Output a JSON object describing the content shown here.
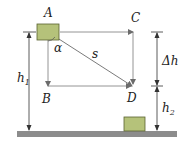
{
  "diagram": {
    "type": "physics-kinematics",
    "labels": {
      "A": "A",
      "B": "B",
      "C": "C",
      "D": "D",
      "s": "s",
      "alpha": "α",
      "h1_main": "h",
      "h1_sub": "1",
      "h2_main": "h",
      "h2_sub": "2",
      "delta_h": "Δh"
    },
    "colors": {
      "block_fill": "#b5c27a",
      "block_stroke": "#5a6330",
      "line": "#6b6b6b",
      "ground": "#8c8c8c",
      "text": "#222222"
    }
  }
}
